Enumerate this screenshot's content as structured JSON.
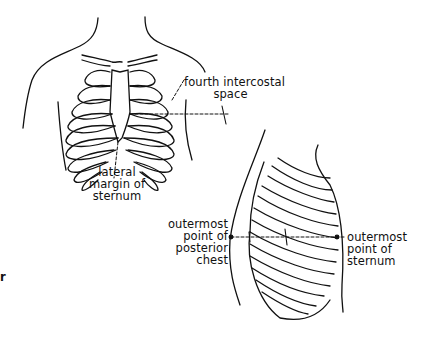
{
  "figure": {
    "front_view": {
      "labels": {
        "fourth_intercostal": [
          "fourth intercostal",
          "space"
        ],
        "lateral_margin": [
          "lateral",
          "margin of",
          "sternum"
        ]
      }
    },
    "lateral_view": {
      "labels": {
        "posterior": [
          "outermost",
          "point of",
          "posterior",
          "chest"
        ],
        "sternum": [
          "outermost",
          "point of",
          "sternum"
        ]
      }
    },
    "stray_mark": "r"
  }
}
